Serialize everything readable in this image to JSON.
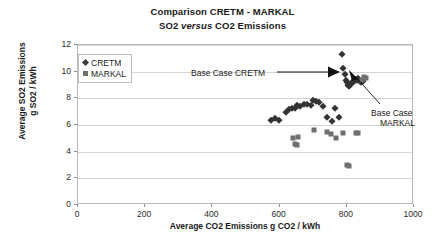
{
  "chart_data": {
    "type": "scatter",
    "title": "Comparison CRETM - MARKAL",
    "subtitle_pre": "SO2 ",
    "subtitle_italic": "versus",
    "subtitle_post": " CO2 Emissions",
    "xlabel": "Average CO2 Emissions g CO2 / kWh",
    "ylabel_line1": "Average SO2 Emissions",
    "ylabel_line2": "g SO2 / kWh",
    "xlim": [
      0,
      1000
    ],
    "ylim": [
      0,
      12
    ],
    "xticks": [
      0,
      200,
      400,
      600,
      800,
      1000
    ],
    "yticks": [
      0,
      2,
      4,
      6,
      8,
      10,
      12
    ],
    "grid": "horizontal",
    "legend_position": "top-left-inside",
    "marker_colors": {
      "CRETM": "#333333",
      "MARKAL": "#6f6f6f"
    },
    "series": [
      {
        "name": "CRETM",
        "marker": "diamond",
        "points": [
          [
            575,
            6.4
          ],
          [
            585,
            6.5
          ],
          [
            598,
            6.4
          ],
          [
            620,
            7.0
          ],
          [
            628,
            7.2
          ],
          [
            636,
            7.3
          ],
          [
            645,
            7.3
          ],
          [
            652,
            7.5
          ],
          [
            660,
            7.4
          ],
          [
            672,
            7.6
          ],
          [
            681,
            7.6
          ],
          [
            692,
            7.5
          ],
          [
            700,
            7.9
          ],
          [
            707,
            7.8
          ],
          [
            716,
            7.7
          ],
          [
            728,
            7.4
          ],
          [
            742,
            6.6
          ],
          [
            755,
            6.3
          ],
          [
            766,
            7.3
          ],
          [
            778,
            6.6
          ],
          [
            786,
            11.3
          ],
          [
            790,
            10.3
          ],
          [
            795,
            9.8
          ],
          [
            797,
            9.4
          ],
          [
            800,
            9.2
          ],
          [
            803,
            9.0
          ],
          [
            806,
            9.1
          ],
          [
            808,
            8.9
          ],
          [
            812,
            9.1
          ],
          [
            815,
            9.2
          ],
          [
            820,
            9.3
          ],
          [
            824,
            9.4
          ],
          [
            829,
            9.4
          ],
          [
            834,
            9.5
          ],
          [
            838,
            9.3
          ],
          [
            843,
            9.2
          ],
          [
            848,
            9.3
          ]
        ]
      },
      {
        "name": "MARKAL",
        "marker": "square",
        "points": [
          [
            640,
            5.0
          ],
          [
            646,
            4.6
          ],
          [
            651,
            4.5
          ],
          [
            655,
            5.1
          ],
          [
            703,
            5.6
          ],
          [
            740,
            5.5
          ],
          [
            752,
            5.3
          ],
          [
            768,
            5.0
          ],
          [
            790,
            5.4
          ],
          [
            800,
            3.0
          ],
          [
            806,
            2.9
          ],
          [
            826,
            5.4
          ],
          [
            832,
            5.4
          ],
          [
            845,
            9.4
          ],
          [
            852,
            9.6
          ],
          [
            858,
            9.5
          ]
        ]
      }
    ],
    "annotations": [
      {
        "id": "base-case-cretm",
        "text": "Base Case CRETM",
        "target": [
          800,
          9.2
        ],
        "style": "arrow-right"
      },
      {
        "id": "base-case-markal",
        "text_line1": "Base Case",
        "text_line2": "MARKAL",
        "target": [
          852,
          9.5
        ],
        "style": "leader-line"
      }
    ]
  },
  "legend": {
    "items": [
      {
        "label": "CRETM",
        "marker": "diamond"
      },
      {
        "label": "MARKAL",
        "marker": "square"
      }
    ]
  }
}
